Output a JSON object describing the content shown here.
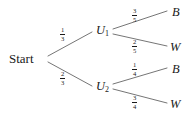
{
  "diagram": {
    "type": "probability-tree",
    "title": "",
    "root": {
      "label": "Start",
      "x": 30,
      "y": 59
    },
    "internal_nodes": [
      {
        "id": "U1",
        "label": "U",
        "subscript": "1",
        "x": 101,
        "y": 31
      },
      {
        "id": "U2",
        "label": "U",
        "subscript": "2",
        "x": 101,
        "y": 87
      }
    ],
    "leaf_nodes": [
      {
        "id": "B1",
        "label": "B",
        "x": 176,
        "y": 13
      },
      {
        "id": "W1",
        "label": "W",
        "x": 176,
        "y": 48
      },
      {
        "id": "B2",
        "label": "B",
        "x": 176,
        "y": 70
      },
      {
        "id": "W2",
        "label": "W",
        "x": 176,
        "y": 105
      }
    ],
    "edges": [
      {
        "from": "Start",
        "to": "U1",
        "numerator": "1",
        "denominator": "3",
        "label_x": 63,
        "label_y": 33
      },
      {
        "from": "Start",
        "to": "U2",
        "numerator": "2",
        "denominator": "3",
        "label_x": 63,
        "label_y": 77
      },
      {
        "from": "U1",
        "to": "B1",
        "numerator": "3",
        "denominator": "5",
        "label_x": 135,
        "label_y": 14
      },
      {
        "from": "U1",
        "to": "W1",
        "numerator": "2",
        "denominator": "5",
        "label_x": 135,
        "label_y": 45
      },
      {
        "from": "U2",
        "to": "B2",
        "numerator": "1",
        "denominator": "4",
        "label_x": 135,
        "label_y": 68
      },
      {
        "from": "U2",
        "to": "W2",
        "numerator": "3",
        "denominator": "4",
        "label_x": 135,
        "label_y": 101
      }
    ],
    "colors": {
      "line": "#3a3a3a",
      "text": "#1a1a1a",
      "background": "#ffffff"
    }
  }
}
